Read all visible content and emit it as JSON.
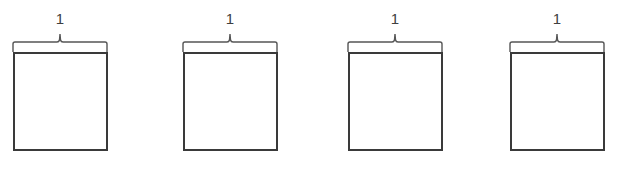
{
  "diagram": {
    "stroke_color": "#3a3a3a",
    "label_color": "#404040",
    "items": [
      {
        "label": "1",
        "shape": "square"
      },
      {
        "label": "1",
        "shape": "square"
      },
      {
        "label": "1",
        "shape": "square"
      },
      {
        "label": "1",
        "shape": "square"
      }
    ]
  }
}
